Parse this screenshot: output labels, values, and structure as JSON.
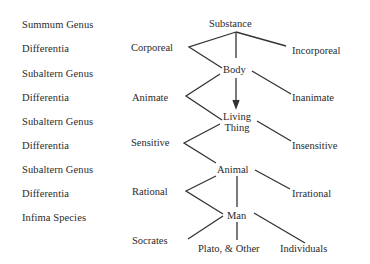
{
  "levels": [
    {
      "label": "Summum Genus"
    },
    {
      "label": "Differentia"
    },
    {
      "label": "Subaltern Genus"
    },
    {
      "label": "Differentia"
    },
    {
      "label": "Subaltern Genus"
    },
    {
      "label": "Differentia"
    },
    {
      "label": "Subaltern Genus"
    },
    {
      "label": "Differentia"
    },
    {
      "label": "Infima Species"
    }
  ],
  "tree": {
    "substance": "Substance",
    "corporeal": "Corporeal",
    "incorporeal": "Incorporeal",
    "body": "Body",
    "animate": "Animate",
    "inanimate": "Inanimate",
    "living_line1": "Living",
    "living_line2": "Thing",
    "sensitive": "Sensitive",
    "insensitive": "Insensitive",
    "animal": "Animal",
    "rational": "Rational",
    "irrational": "Irrational",
    "man": "Man",
    "socrates": "Socrates",
    "plato": "Plato, & Other",
    "individuals": "Individuals"
  }
}
